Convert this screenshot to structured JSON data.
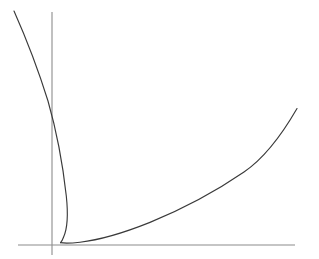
{
  "figure": {
    "background_color": "#ffffff",
    "width": 319,
    "height": 259,
    "title": ""
  },
  "axes": {
    "x_axis": {
      "name": "horizontal-axis",
      "color": "#8c8c8c",
      "y_pixel": 245,
      "x_start_pixel": 18,
      "x_end_pixel": 295,
      "label": "",
      "ticks": [],
      "tick_labels": []
    },
    "y_axis": {
      "name": "vertical-axis",
      "color": "#8c8c8c",
      "x_pixel": 52,
      "y_start_pixel": 12,
      "y_end_pixel": 255,
      "label": "",
      "ticks": [],
      "tick_labels": []
    }
  },
  "chart_data": {
    "type": "line",
    "title": "",
    "subtitle": "",
    "xlabel": "",
    "ylabel": "",
    "grid": false,
    "legend": [],
    "legend_position": "none",
    "annotations": [],
    "xlim": [
      -0.45,
      2.45
    ],
    "ylim": [
      -0.05,
      2.45
    ],
    "axis_origin_pixel": [
      52,
      245
    ],
    "line_color": "#3a3a3a",
    "line_width": 1.15,
    "series": [
      {
        "name": "upper-branch",
        "points_pixel": [
          [
            14,
            11
          ],
          [
            20,
            25
          ],
          [
            26,
            39
          ],
          [
            32,
            54
          ],
          [
            38,
            69
          ],
          [
            44,
            86
          ],
          [
            48,
            101
          ],
          [
            51,
            117
          ],
          [
            54,
            131
          ],
          [
            57,
            147
          ],
          [
            60,
            162
          ],
          [
            63,
            177
          ],
          [
            65,
            191
          ],
          [
            66.5,
            203
          ],
          [
            67.5,
            213
          ],
          [
            67.5,
            222
          ],
          [
            66.5,
            230
          ],
          [
            64.5,
            236
          ],
          [
            62.5,
            240
          ],
          [
            60.5,
            242.6
          ]
        ]
      },
      {
        "name": "lower-branch",
        "points_pixel": [
          [
            60.5,
            242.6
          ],
          [
            66,
            243.2
          ],
          [
            74,
            242.6
          ],
          [
            85,
            241.2
          ],
          [
            98,
            238.8
          ],
          [
            112,
            235.4
          ],
          [
            128,
            230.8
          ],
          [
            144,
            225.4
          ],
          [
            160,
            219.2
          ],
          [
            176,
            212.2
          ],
          [
            192,
            204.4
          ],
          [
            208,
            195.8
          ],
          [
            224,
            186.4
          ],
          [
            240,
            176.2
          ],
          [
            256,
            165.2
          ],
          [
            270,
            150.6
          ],
          [
            282,
            133.4
          ],
          [
            291,
            119.4
          ],
          [
            297,
            108.5
          ]
        ]
      }
    ],
    "x": [
      0.0,
      0.1,
      0.2,
      0.3,
      0.4,
      0.5,
      0.6,
      0.7,
      0.8,
      0.9,
      1.0,
      1.1,
      1.2,
      1.3,
      1.4,
      1.5,
      1.6,
      1.7,
      1.8,
      1.9,
      2.0,
      2.1,
      2.2
    ],
    "values": [
      0.0,
      0.02,
      0.05,
      0.09,
      0.14,
      0.2,
      0.27,
      0.34,
      0.42,
      0.51,
      0.6,
      0.7,
      0.8,
      0.91,
      1.02,
      1.14,
      1.26,
      1.38,
      1.51,
      1.64,
      1.78,
      1.92,
      2.06
    ]
  },
  "curves": {
    "upper_branch_path": "M 14 11 C 26 38, 38 69, 48 101 C 56 129, 63 166, 66.3 196 C 68 212, 68.2 227, 63.5 237.2 C 62.4 240.2, 61.4 241.8, 60.5 242.6",
    "lower_branch_path": "M 60.5 242.6 C 64 243.3, 70 243.3, 80 242.2 C 100 240, 124 232.8, 150 222.4 C 180 210, 214 192.6, 244 172 C 266 157, 284 131, 297 108.5"
  }
}
